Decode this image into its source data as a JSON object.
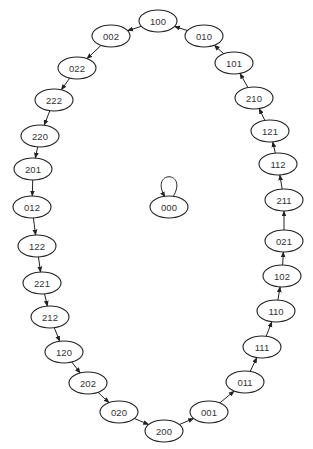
{
  "diagram": {
    "type": "state-transition-graph",
    "ellipse": {
      "rx": 19,
      "ry": 11
    },
    "colors": {
      "stroke": "#222222",
      "fill": "#ffffff",
      "text": "#333333"
    },
    "nodes": [
      {
        "id": "100",
        "label": "100",
        "x": 158,
        "y": 21
      },
      {
        "id": "010",
        "label": "010",
        "x": 204,
        "y": 36
      },
      {
        "id": "101",
        "label": "101",
        "x": 234,
        "y": 63
      },
      {
        "id": "210",
        "label": "210",
        "x": 254,
        "y": 98
      },
      {
        "id": "121",
        "label": "121",
        "x": 270,
        "y": 131
      },
      {
        "id": "112",
        "label": "112",
        "x": 278,
        "y": 164
      },
      {
        "id": "211",
        "label": "211",
        "x": 284,
        "y": 200
      },
      {
        "id": "021",
        "label": "021",
        "x": 284,
        "y": 241
      },
      {
        "id": "102",
        "label": "102",
        "x": 282,
        "y": 276
      },
      {
        "id": "110",
        "label": "110",
        "x": 276,
        "y": 311
      },
      {
        "id": "111",
        "label": "111",
        "x": 262,
        "y": 347
      },
      {
        "id": "011",
        "label": "011",
        "x": 245,
        "y": 382
      },
      {
        "id": "001",
        "label": "001",
        "x": 209,
        "y": 412
      },
      {
        "id": "200",
        "label": "200",
        "x": 164,
        "y": 431
      },
      {
        "id": "020",
        "label": "020",
        "x": 119,
        "y": 412
      },
      {
        "id": "202",
        "label": "202",
        "x": 88,
        "y": 383
      },
      {
        "id": "120",
        "label": "120",
        "x": 64,
        "y": 352
      },
      {
        "id": "212",
        "label": "212",
        "x": 50,
        "y": 317
      },
      {
        "id": "221",
        "label": "221",
        "x": 42,
        "y": 283
      },
      {
        "id": "122",
        "label": "122",
        "x": 37,
        "y": 246
      },
      {
        "id": "012",
        "label": "012",
        "x": 32,
        "y": 207
      },
      {
        "id": "201",
        "label": "201",
        "x": 33,
        "y": 169
      },
      {
        "id": "220",
        "label": "220",
        "x": 40,
        "y": 136
      },
      {
        "id": "222",
        "label": "222",
        "x": 54,
        "y": 100
      },
      {
        "id": "022",
        "label": "022",
        "x": 77,
        "y": 68
      },
      {
        "id": "002",
        "label": "002",
        "x": 111,
        "y": 36
      },
      {
        "id": "000",
        "label": "000",
        "x": 169,
        "y": 207
      }
    ],
    "edges": [
      [
        "100",
        "002"
      ],
      [
        "002",
        "022"
      ],
      [
        "022",
        "222"
      ],
      [
        "222",
        "220"
      ],
      [
        "220",
        "201"
      ],
      [
        "201",
        "012"
      ],
      [
        "012",
        "122"
      ],
      [
        "122",
        "221"
      ],
      [
        "221",
        "212"
      ],
      [
        "212",
        "120"
      ],
      [
        "120",
        "202"
      ],
      [
        "202",
        "020"
      ],
      [
        "020",
        "200"
      ],
      [
        "200",
        "001"
      ],
      [
        "001",
        "011"
      ],
      [
        "011",
        "111"
      ],
      [
        "111",
        "110"
      ],
      [
        "110",
        "102"
      ],
      [
        "102",
        "021"
      ],
      [
        "021",
        "211"
      ],
      [
        "211",
        "112"
      ],
      [
        "112",
        "121"
      ],
      [
        "121",
        "210"
      ],
      [
        "210",
        "101"
      ],
      [
        "101",
        "010"
      ],
      [
        "010",
        "100"
      ],
      [
        "000",
        "000"
      ]
    ]
  }
}
